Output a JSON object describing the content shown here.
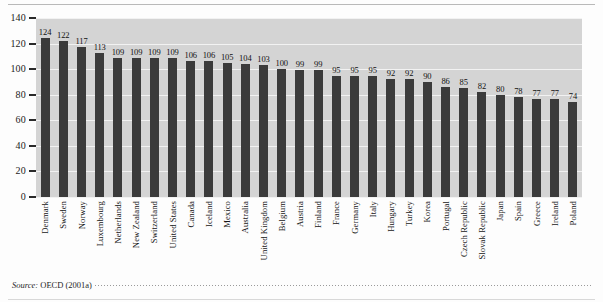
{
  "figure": {
    "source_prefix": "Source:",
    "source_body": "OECD (2001a)"
  },
  "axis": {
    "y_ticks": [
      "140",
      "120",
      "100",
      "80",
      "60",
      "40",
      "20",
      "0"
    ]
  },
  "chart_data": {
    "type": "bar",
    "title": "",
    "subtitle": "",
    "xlabel": "",
    "ylabel": "",
    "ylim": [
      0,
      140
    ],
    "y_ticks": [
      0,
      20,
      40,
      60,
      80,
      100,
      120,
      140
    ],
    "grid": true,
    "legend": null,
    "bar_color": "#3b3b3b",
    "plot_background": "#d4d4d4",
    "gridline_color": "#f2f2f2",
    "data_labels": true,
    "categories": [
      "Denmark",
      "Sweden",
      "Norway",
      "Luxembourg",
      "Netherlands",
      "New Zealand",
      "Switzerland",
      "United States",
      "Canada",
      "Iceland",
      "Mexico",
      "Australia",
      "United Kingdom",
      "Belgium",
      "Austria",
      "Finland",
      "France",
      "Germany",
      "Italy",
      "Hungary",
      "Turkey",
      "Korea",
      "Portugal",
      "Czech Republic",
      "Slovak Republic",
      "Japan",
      "Spain",
      "Greece",
      "Ireland",
      "Poland"
    ],
    "values": [
      124,
      122,
      117,
      113,
      109,
      109,
      109,
      109,
      106,
      106,
      105,
      104,
      103,
      100,
      99,
      99,
      95,
      95,
      95,
      92,
      92,
      90,
      86,
      85,
      82,
      80,
      78,
      77,
      77,
      74
    ],
    "value_labels": [
      "124",
      "122",
      "117",
      "113",
      "109",
      "109",
      "109",
      "109",
      "106",
      "106",
      "105",
      "104",
      "103",
      "100",
      "99",
      "99",
      "95",
      "95",
      "95",
      "92",
      "92",
      "90",
      "86",
      "85",
      "82",
      "80",
      "78",
      "77",
      "77",
      "74"
    ]
  }
}
